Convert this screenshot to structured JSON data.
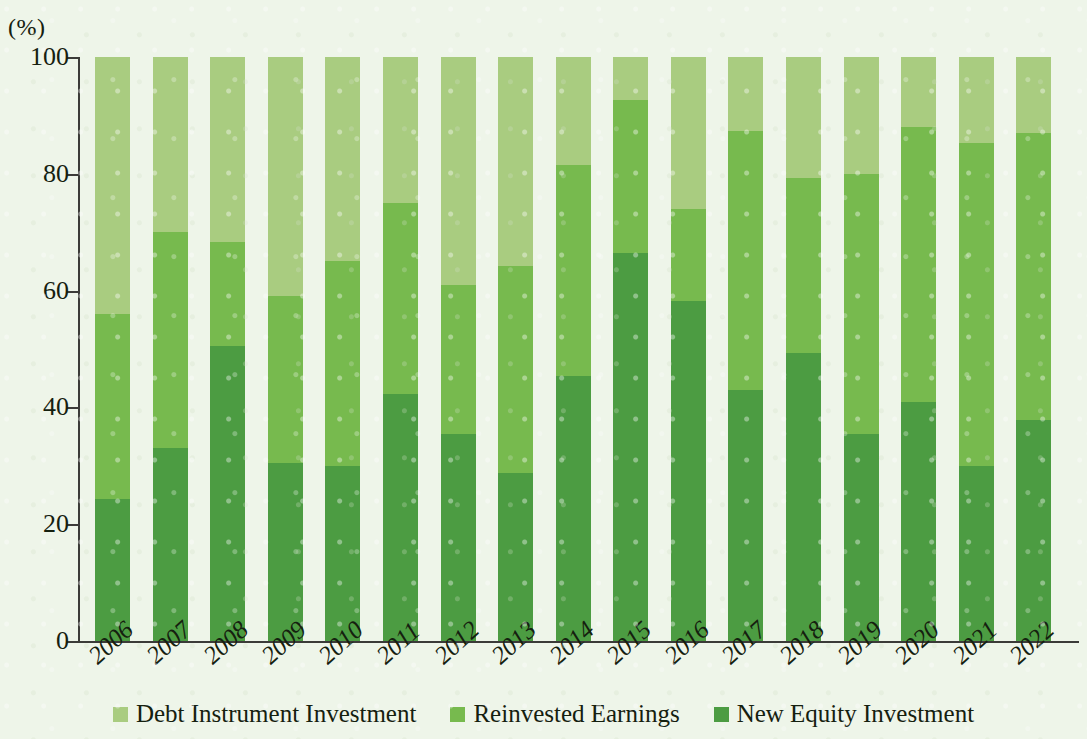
{
  "chart_data": {
    "type": "bar",
    "subtype": "stacked-percentage",
    "title": "",
    "subtitle": "",
    "unit_label": "(%)",
    "xlabel": "",
    "ylabel": "",
    "ylim": [
      0,
      100
    ],
    "yticks": [
      "0",
      "20",
      "40",
      "60",
      "80",
      "100"
    ],
    "grid": false,
    "legend_position": "bottom-center",
    "categories": [
      "2006",
      "2007",
      "2008",
      "2009",
      "2010",
      "2011",
      "2012",
      "2013",
      "2014",
      "2015",
      "2016",
      "2017",
      "2018",
      "2019",
      "2020",
      "2021",
      "2022"
    ],
    "series": [
      {
        "name": "New Equity Investment",
        "color": "#4c9c42",
        "stack_order": 1,
        "values": [
          24.3,
          33.0,
          50.5,
          30.5,
          30.0,
          42.3,
          35.5,
          28.7,
          45.3,
          66.5,
          58.3,
          43.0,
          49.4,
          35.4,
          41.0,
          30.0,
          37.8
        ]
      },
      {
        "name": "Reinvested Earnings",
        "color": "#77ba4e",
        "stack_order": 2,
        "values": [
          31.7,
          37.0,
          17.8,
          28.5,
          35.0,
          32.7,
          25.5,
          35.6,
          36.2,
          26.2,
          15.7,
          44.3,
          29.8,
          44.6,
          47.0,
          55.2,
          49.2
        ]
      },
      {
        "name": "Debt Instrument Investment",
        "color": "#a9cc80",
        "stack_order": 3,
        "values": [
          44.0,
          30.0,
          31.7,
          41.0,
          35.0,
          25.0,
          39.0,
          35.7,
          18.5,
          7.3,
          26.0,
          12.7,
          20.8,
          20.0,
          12.0,
          14.8,
          13.0
        ]
      }
    ],
    "cumulative_tops": {
      "new_equity_investment": [
        24.3,
        33.0,
        50.5,
        30.5,
        30.0,
        42.3,
        35.5,
        28.7,
        45.3,
        66.5,
        58.3,
        43.0,
        49.4,
        35.4,
        41.0,
        30.0,
        37.8
      ],
      "reinvested_earnings": [
        56.0,
        70.0,
        68.3,
        59.0,
        65.0,
        75.0,
        61.0,
        64.3,
        81.5,
        92.7,
        74.0,
        87.3,
        79.2,
        80.0,
        88.0,
        85.2,
        87.0
      ],
      "debt_instrument_investment": [
        100,
        100,
        100,
        100,
        100,
        100,
        100,
        100,
        100,
        100,
        100,
        100,
        100,
        100,
        100,
        100,
        100
      ]
    }
  },
  "legend": {
    "items": [
      {
        "label": "Debt Instrument Investment",
        "color": "#a9cc80"
      },
      {
        "label": "Reinvested Earnings",
        "color": "#77ba4e"
      },
      {
        "label": "New Equity Investment",
        "color": "#4c9c42"
      }
    ]
  },
  "colors": {
    "background": "#eef5e9",
    "axis": "#3b3b38",
    "text": "#15200f",
    "debt_instrument_investment": "#a9cc80",
    "reinvested_earnings": "#77ba4e",
    "new_equity_investment": "#4c9c42"
  }
}
